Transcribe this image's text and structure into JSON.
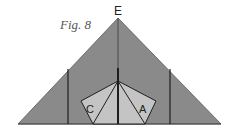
{
  "figure": {
    "caption": "Fig. 8",
    "apex_label": "E",
    "region_labels": {
      "left": "C",
      "right": "A"
    }
  },
  "colors": {
    "triangle_fill": "#8a8a8a",
    "pentagon_fill": "#c4c4c4",
    "stroke": "#1e1e1e",
    "background": "#ffffff"
  },
  "geometry": {
    "triangle": {
      "apex": [
        118,
        18
      ],
      "left": [
        18,
        124
      ],
      "right": [
        221,
        124
      ]
    },
    "vertical_lines": {
      "left_x": 68,
      "right_x": 170,
      "top_y": 69,
      "bottom_y": 124
    },
    "center_line": {
      "x": 118,
      "top_y": 18,
      "bottom_y": 124
    },
    "pentagon": {
      "top": [
        118,
        81
      ],
      "left": [
        81,
        101
      ],
      "bottom_left": [
        93,
        124
      ],
      "bottom_right": [
        145,
        124
      ],
      "right": [
        156,
        101
      ]
    }
  }
}
